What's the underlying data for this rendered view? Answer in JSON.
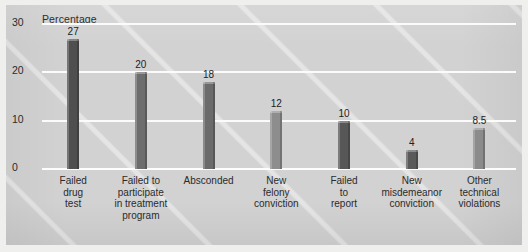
{
  "figure": {
    "background_color": "#d2d2d2",
    "gridline_color": "#fbfbfb",
    "text_color": "#2b2b2b"
  },
  "chart_data": {
    "type": "bar",
    "title": "",
    "ylabel": "Percentage",
    "xlabel": "",
    "ylim": [
      0,
      30
    ],
    "yticks": [
      "0",
      "10",
      "20",
      "30"
    ],
    "grid": true,
    "legend": "none",
    "orientation": "vertical",
    "categories": [
      "Failed drug test",
      "Failed to participate in treatment program",
      "Absconded",
      "New felony conviction",
      "Failed to report",
      "New misdemeanor conviction",
      "Other technical violations"
    ],
    "category_lines": [
      [
        "Failed",
        "drug",
        "test"
      ],
      [
        "Failed to",
        "participate",
        "in treatment",
        "program"
      ],
      [
        "Absconded"
      ],
      [
        "New",
        "felony",
        "conviction"
      ],
      [
        "Failed",
        "to",
        "report"
      ],
      [
        "New",
        "misdemeanor",
        "conviction"
      ],
      [
        "Other",
        "technical",
        "violations"
      ]
    ],
    "values": [
      27,
      20,
      18,
      12,
      10,
      4,
      8.5
    ],
    "value_labels": [
      "27",
      "20",
      "18",
      "12",
      "10",
      "4",
      "8.5"
    ],
    "bar_colors": [
      "#4f4f4f",
      "#6d6d6d",
      "#6b6b6b",
      "#8d8d8d",
      "#575757",
      "#5a5a5a",
      "#8b8b8b"
    ]
  }
}
